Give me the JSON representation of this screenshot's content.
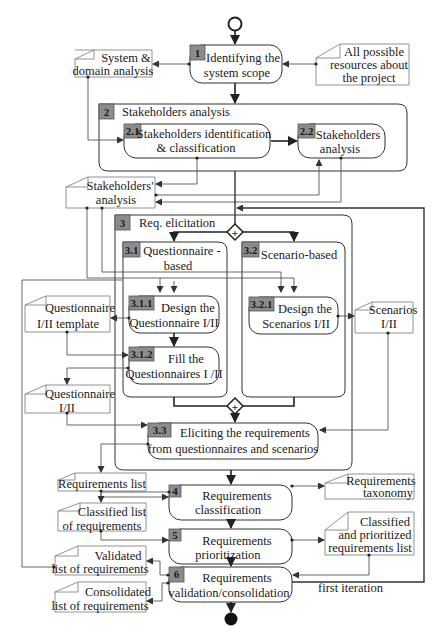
{
  "diagram": {
    "type": "activity-flow",
    "start_node": "start",
    "end_node": "end",
    "steps": [
      {
        "id": "1",
        "number": "1",
        "lines": [
          "Identifying the",
          "system scope"
        ]
      },
      {
        "id": "2",
        "number": "2",
        "lines": [
          "Stakeholders analysis"
        ]
      },
      {
        "id": "2.1",
        "number": "2.1",
        "lines": [
          "Stakeholders identification",
          "& classification"
        ]
      },
      {
        "id": "2.2",
        "number": "2.2",
        "lines": [
          "Stakeholders",
          "analysis"
        ]
      },
      {
        "id": "3",
        "number": "3",
        "lines": [
          "Req. elicitation"
        ]
      },
      {
        "id": "3.1",
        "number": "3.1",
        "lines": [
          "Questionnaire -",
          "based"
        ]
      },
      {
        "id": "3.2",
        "number": "3.2",
        "lines": [
          "Scenario-based"
        ]
      },
      {
        "id": "3.1.1",
        "number": "3.1.1",
        "lines": [
          "Design the",
          "Questionnaire I/II"
        ]
      },
      {
        "id": "3.1.2",
        "number": "3.1.2",
        "lines": [
          "Fill the",
          "Questionnaires I /II"
        ]
      },
      {
        "id": "3.2.1",
        "number": "3.2.1",
        "lines": [
          "Design the",
          "Scenarios  I/II"
        ]
      },
      {
        "id": "3.3",
        "number": "3.3",
        "lines": [
          "Eliciting the requirements",
          "from questionnaires  and scenarios"
        ]
      },
      {
        "id": "4",
        "number": "4",
        "lines": [
          "Requirements",
          "classification"
        ]
      },
      {
        "id": "5",
        "number": "5",
        "lines": [
          "Requirements",
          "prioritization"
        ]
      },
      {
        "id": "6",
        "number": "6",
        "lines": [
          "Requirements",
          "validation/consolidation"
        ]
      }
    ],
    "artifacts": [
      {
        "id": "system-domain-analysis",
        "lines": [
          "System &",
          "domain analysis"
        ]
      },
      {
        "id": "all-possible-resources",
        "lines": [
          "All possible",
          "resources about",
          "the project"
        ]
      },
      {
        "id": "stakeholders-analysis-doc",
        "lines": [
          "Stakeholders'",
          "analysis"
        ]
      },
      {
        "id": "questionnaire-template",
        "lines": [
          "Questionnaire",
          "I/II template"
        ]
      },
      {
        "id": "questionnaire",
        "lines": [
          "Questionnaire",
          "I/II"
        ]
      },
      {
        "id": "scenarios",
        "lines": [
          "Scenarios",
          "I/II"
        ]
      },
      {
        "id": "requirements-list",
        "lines": [
          "Requirements list"
        ]
      },
      {
        "id": "requirements-taxonomy",
        "lines": [
          "Requirements",
          "taxonomy"
        ]
      },
      {
        "id": "classified-list",
        "lines": [
          "Classified  list",
          "of requirements"
        ]
      },
      {
        "id": "classified-prioritized",
        "lines": [
          "Classified",
          "and prioritized",
          "requirements list"
        ]
      },
      {
        "id": "validated-list",
        "lines": [
          "Validated",
          "list of requirements"
        ]
      },
      {
        "id": "consolidated-list",
        "lines": [
          "Consolidated",
          "list of requirements"
        ]
      }
    ],
    "annotations": {
      "loop_label": "first iteration"
    },
    "gateways": [
      {
        "id": "fork-3",
        "symbol": "+"
      },
      {
        "id": "join-3",
        "symbol": "+"
      }
    ],
    "colors": {
      "badge_fill": "#8c8c8c",
      "line": "#555555",
      "flow_line": "#222222",
      "text": "#1a1a1a"
    }
  }
}
